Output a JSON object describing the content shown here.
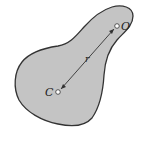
{
  "diagram": {
    "type": "rigid-body-centroid-figure",
    "body_fill": "#c4c4c4",
    "outline_color": "#333333",
    "points": {
      "centroid": {
        "label": "C",
        "x": 58,
        "y": 92
      },
      "reference": {
        "label": "O",
        "x": 117,
        "y": 26
      }
    },
    "distance_label": "r"
  }
}
